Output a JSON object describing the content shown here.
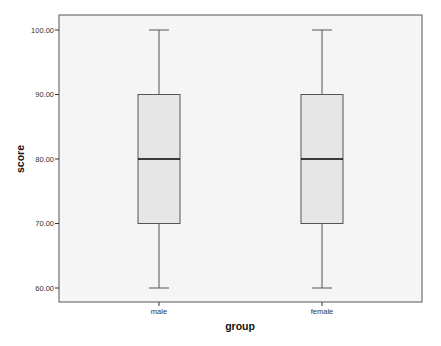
{
  "chart_data": {
    "type": "boxplot",
    "title": "",
    "xlabel": "group",
    "ylabel": "score",
    "ylim": [
      60,
      100
    ],
    "y_ticks": [
      "60.00",
      "70.00",
      "80.00",
      "90.00",
      "100.00"
    ],
    "categories": [
      "male",
      "female"
    ],
    "series": [
      {
        "name": "male",
        "min": 60,
        "q1": 70,
        "median": 80,
        "q3": 90,
        "max": 100
      },
      {
        "name": "female",
        "min": 60,
        "q1": 70,
        "median": 80,
        "q3": 90,
        "max": 100
      }
    ],
    "grid": false,
    "legend": null,
    "colors": {
      "plot_background": "#f5f5f5",
      "box_fill": "#e6e6e6",
      "box_stroke": "#555555",
      "median_stroke": "#000000",
      "frame_stroke": "#555555"
    }
  }
}
